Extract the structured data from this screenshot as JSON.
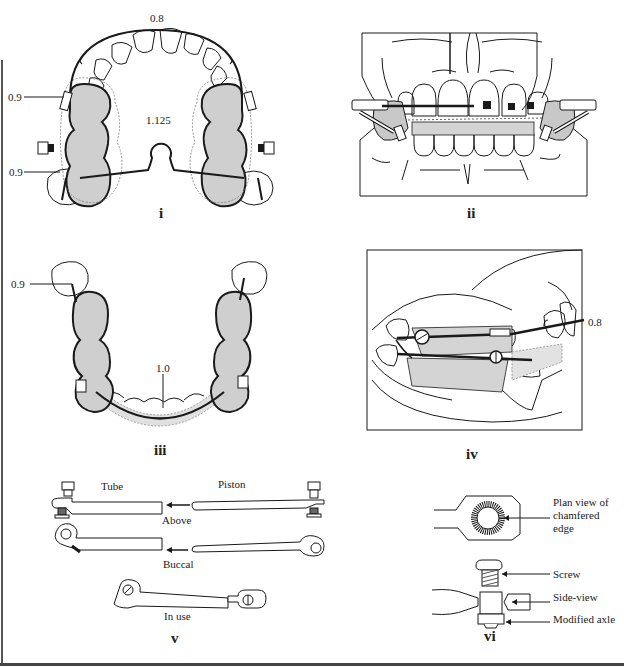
{
  "figure": {
    "panels": [
      {
        "id": "i",
        "numeral": "i",
        "description": "Upper arch occlusal view with appliance",
        "labels": {
          "labial_wire": "0.8",
          "palatal": "1.125",
          "upper_clasp": "0.9",
          "lower_clasp": "0.9"
        }
      },
      {
        "id": "ii",
        "numeral": "ii",
        "description": "Frontal view of appliance in occlusion"
      },
      {
        "id": "iii",
        "numeral": "iii",
        "description": "Lower arch occlusal view with appliance",
        "labels": {
          "clasp": "0.9",
          "lingual_bar": "1.0"
        }
      },
      {
        "id": "iv",
        "numeral": "iv",
        "description": "Lateral view of appliance in occlusion",
        "labels": {
          "labial_wire": "0.8"
        }
      },
      {
        "id": "v",
        "numeral": "v",
        "description": "Tube and piston components",
        "labels": {
          "tube": "Tube",
          "piston": "Piston",
          "above": "Above",
          "buccal": "Buccal",
          "in_use": "In use"
        }
      },
      {
        "id": "vi",
        "numeral": "vi",
        "description": "Screw and modified axle detail",
        "labels": {
          "plan_view": "Plan view of chamfered edge",
          "plan_view_lines": [
            "Plan view of",
            "chamfered",
            "edge"
          ],
          "screw": "Screw",
          "side_view": "Side-view",
          "modified_axle": "Modified axle"
        }
      }
    ],
    "colors": {
      "line": "#1a1a1a",
      "acrylic_fill": "#cfcfcf",
      "hatch": "#9a9a9a",
      "background": "#ffffff"
    }
  }
}
